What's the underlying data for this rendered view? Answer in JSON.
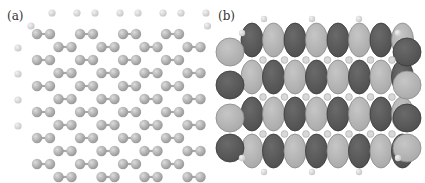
{
  "figure": {
    "panels": [
      {
        "id": "a",
        "label": "(a)",
        "content": "graphene flake atomic structure (carbon + edge hydrogen atoms)"
      },
      {
        "id": "b",
        "label": "(b)",
        "content": "molecular orbital isosurface over graphene flake"
      }
    ]
  },
  "colors": {
    "background": "#ffffff",
    "carbon": "#9a9a9a",
    "carbon_highlight": "#dcdcdc",
    "hydrogen": "#c8c8c8",
    "bond": "#a8a8a8",
    "lobe_dark": "#4f4f4f",
    "lobe_light": "#a9a9a9",
    "lobe_edge": "#3a3a3a"
  },
  "lattice": {
    "cols": 8,
    "rows": 6,
    "origin_a": [
      37,
      40
    ],
    "origin_b": [
      249,
      40
    ],
    "dx": 20.5,
    "dy": 26,
    "atom_r": 5.2,
    "h_r": 3.6
  }
}
